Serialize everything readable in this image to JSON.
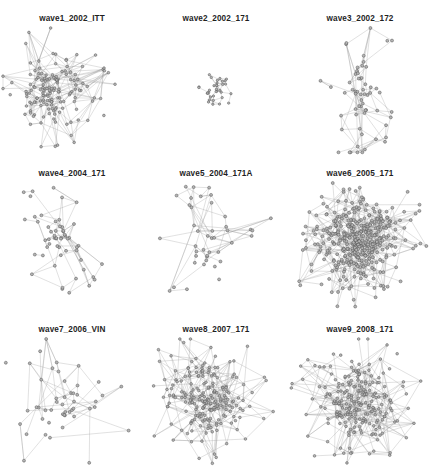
{
  "figure": {
    "type": "network-graph-grid",
    "rows": 3,
    "cols": 3,
    "background_color": "#ffffff",
    "node_fill": "#b4b4b4",
    "node_stroke": "#4a4a4a",
    "edge_color": "#9a9a9a",
    "label_color": "#1f1f1f",
    "partial_top_row_visible": true
  },
  "panels": [
    {
      "label": "wave1_2002_ITT",
      "row": 0,
      "col": 0,
      "nodes": 150,
      "edges": 330,
      "density": "dense",
      "layout": "hairball-core-with-spokes",
      "seed": 11,
      "center_x": 0.36,
      "center_y": 0.5,
      "core_radius": 0.2,
      "spread": 0.3,
      "spoke_count": 16
    },
    {
      "label": "wave2_2002_171",
      "row": 0,
      "col": 1,
      "nodes": 34,
      "edges": 62,
      "density": "compact-small",
      "layout": "tight-cluster",
      "seed": 23,
      "center_x": 0.5,
      "center_y": 0.5,
      "core_radius": 0.09,
      "spread": 0.1,
      "spoke_count": 3
    },
    {
      "label": "wave3_2002_172",
      "row": 0,
      "col": 2,
      "nodes": 60,
      "edges": 95,
      "density": "sparse",
      "layout": "elongated-vertical-branching",
      "seed": 37,
      "center_x": 0.5,
      "center_y": 0.52,
      "core_radius": 0.14,
      "spread": 0.4,
      "spoke_count": 10
    },
    {
      "label": "wave4_2004_171",
      "row": 1,
      "col": 0,
      "nodes": 55,
      "edges": 80,
      "density": "sparse",
      "layout": "scattered-with-long-edges",
      "seed": 51,
      "center_x": 0.4,
      "center_y": 0.46,
      "core_radius": 0.13,
      "spread": 0.33,
      "spoke_count": 12
    },
    {
      "label": "wave5_2004_171A",
      "row": 1,
      "col": 1,
      "nodes": 42,
      "edges": 56,
      "density": "very-sparse",
      "layout": "loose-open-web",
      "seed": 67,
      "center_x": 0.46,
      "center_y": 0.5,
      "core_radius": 0.16,
      "spread": 0.36,
      "spoke_count": 14
    },
    {
      "label": "wave6_2005_171",
      "row": 1,
      "col": 2,
      "nodes": 400,
      "edges": 820,
      "density": "very-dense",
      "layout": "solid-blob",
      "seed": 83,
      "center_x": 0.5,
      "center_y": 0.47,
      "core_radius": 0.26,
      "spread": 0.27,
      "spoke_count": 4
    },
    {
      "label": "wave7_2006_VIN",
      "row": 2,
      "col": 0,
      "nodes": 48,
      "edges": 55,
      "density": "fragmented",
      "layout": "disconnected-components",
      "seed": 97,
      "center_x": 0.44,
      "center_y": 0.52,
      "core_radius": 0.17,
      "spread": 0.4,
      "spoke_count": 10
    },
    {
      "label": "wave8_2007_171",
      "row": 2,
      "col": 1,
      "nodes": 210,
      "edges": 470,
      "density": "dense",
      "layout": "core-with-radiating-spokes",
      "seed": 113,
      "center_x": 0.44,
      "center_y": 0.48,
      "core_radius": 0.22,
      "spread": 0.32,
      "spoke_count": 20
    },
    {
      "label": "wave9_2008_171",
      "row": 2,
      "col": 2,
      "nodes": 230,
      "edges": 520,
      "density": "dense",
      "layout": "core-with-radiating-spokes",
      "seed": 131,
      "center_x": 0.46,
      "center_y": 0.5,
      "core_radius": 0.22,
      "spread": 0.33,
      "spoke_count": 22
    }
  ],
  "top_partial_row": {
    "fragments": [
      "",
      ""
    ]
  }
}
